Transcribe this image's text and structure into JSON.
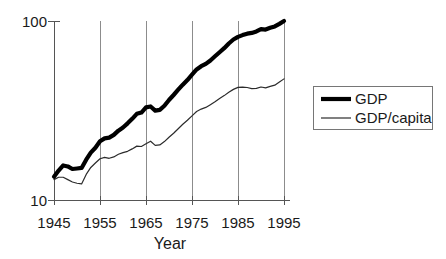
{
  "chart_data": {
    "type": "line",
    "title": "",
    "xlabel": "Year",
    "ylabel": "",
    "xlim": [
      1945,
      1995
    ],
    "ylim": [
      10,
      100
    ],
    "yscale": "log",
    "grid": "vertical",
    "legend_position": "right-outside",
    "x_tick_labels": [
      "1945",
      "1955",
      "1965",
      "1975",
      "1985",
      "1995"
    ],
    "x_ticks": [
      1945,
      1955,
      1965,
      1975,
      1985,
      1995
    ],
    "y_tick_labels": [
      "10",
      "100"
    ],
    "y_ticks": [
      10,
      100
    ],
    "x": [
      1945,
      1946,
      1947,
      1948,
      1949,
      1950,
      1951,
      1952,
      1953,
      1954,
      1955,
      1956,
      1957,
      1958,
      1959,
      1960,
      1961,
      1962,
      1963,
      1964,
      1965,
      1966,
      1967,
      1968,
      1969,
      1970,
      1971,
      1972,
      1973,
      1974,
      1975,
      1976,
      1977,
      1978,
      1979,
      1980,
      1981,
      1982,
      1983,
      1984,
      1985,
      1986,
      1987,
      1988,
      1989,
      1990,
      1991,
      1992,
      1993,
      1994,
      1995
    ],
    "series": [
      {
        "name": "GDP",
        "style": "thick-black",
        "color": "#000000",
        "values": [
          13.5,
          14.6,
          15.6,
          15.4,
          14.9,
          15.0,
          15.1,
          16.8,
          18.4,
          19.6,
          21.3,
          22.1,
          22.3,
          23.1,
          24.4,
          25.4,
          26.8,
          28.4,
          30.3,
          30.8,
          32.9,
          33.3,
          31.6,
          31.9,
          33.6,
          36.2,
          38.6,
          41.3,
          44.1,
          46.8,
          50.1,
          53.6,
          55.9,
          57.6,
          60.2,
          63.5,
          66.9,
          70.5,
          74.9,
          78.8,
          81.5,
          83.4,
          85.0,
          85.8,
          87.4,
          90.1,
          89.6,
          91.6,
          93.3,
          96.4,
          100.0
        ]
      },
      {
        "name": "GDP/capita",
        "style": "thin-black",
        "color": "#2b2b2b",
        "values": [
          13.0,
          13.4,
          13.4,
          13.0,
          12.6,
          12.4,
          12.3,
          13.9,
          15.2,
          16.1,
          17.0,
          17.3,
          17.1,
          17.4,
          18.0,
          18.4,
          18.7,
          19.3,
          20.0,
          19.9,
          20.6,
          21.3,
          20.2,
          20.3,
          21.2,
          22.4,
          23.6,
          25.0,
          26.5,
          27.9,
          29.5,
          31.2,
          32.2,
          32.9,
          34.1,
          35.4,
          36.9,
          38.3,
          40.0,
          41.5,
          42.6,
          42.7,
          42.5,
          41.9,
          42.0,
          42.8,
          42.3,
          43.1,
          43.8,
          45.6,
          47.5
        ]
      }
    ],
    "legend_entries": [
      {
        "label": "GDP",
        "style": "thick-black"
      },
      {
        "label": "GDP/capita",
        "style": "thin-black"
      }
    ],
    "colors": {
      "gdp": "#000000",
      "gdp_per_capita": "#2b2b2b",
      "gridline": "#8c8c8c",
      "axis": "#555555",
      "text": "#1a1a1a",
      "background": "#ffffff"
    }
  }
}
